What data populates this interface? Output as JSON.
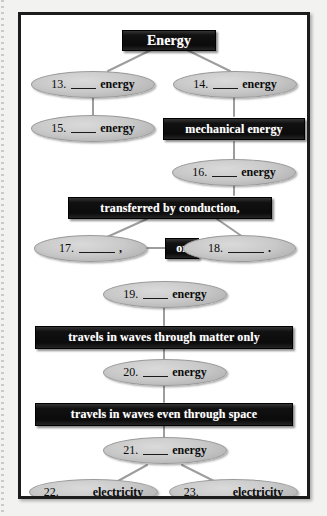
{
  "document": {
    "type": "concept-map-worksheet",
    "title": "Energy concept map",
    "colors": {
      "box_fill": "#131313",
      "box_text": "#ffffff",
      "oval_fill": "#c9c9c9",
      "oval_text": "#0a0a0a",
      "frame_border": "#1c1c1c",
      "page_background": "#f2f2f0",
      "connector": "#9d9d9d"
    }
  },
  "nodes": {
    "root": {
      "label": "Energy"
    },
    "n13": {
      "number": "13.",
      "blank": "",
      "word": "energy"
    },
    "n14": {
      "number": "14.",
      "blank": "",
      "word": "energy"
    },
    "n15": {
      "number": "15.",
      "blank": "",
      "word": "energy"
    },
    "mechanical": {
      "label": "mechanical energy"
    },
    "n16": {
      "number": "16.",
      "blank": "",
      "word": "energy"
    },
    "conduction": {
      "label": "transferred by conduction,"
    },
    "n17": {
      "number": "17.",
      "blank": "",
      "word": ","
    },
    "or": {
      "label": "or"
    },
    "n18": {
      "number": "18.",
      "blank": "",
      "word": "."
    },
    "n19": {
      "number": "19.",
      "blank": "",
      "word": "energy"
    },
    "waves_matter": {
      "label": "travels in waves through matter only"
    },
    "n20": {
      "number": "20.",
      "blank": "",
      "word": "energy"
    },
    "waves_space": {
      "label": "travels in waves even through space"
    },
    "n21": {
      "number": "21.",
      "blank": "",
      "word": "energy"
    },
    "n22": {
      "number": "22.",
      "blank": "",
      "word": "electricity"
    },
    "n23": {
      "number": "23.",
      "blank": "",
      "word": "electricity"
    }
  }
}
